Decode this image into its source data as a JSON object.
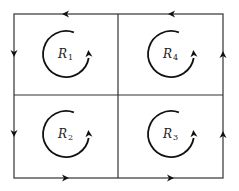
{
  "diagram": {
    "type": "region-decomposition",
    "outer_rectangle": {
      "x1": 14,
      "y1": 14,
      "x2": 223,
      "y2": 178
    },
    "divider": {
      "x": 118,
      "y": 95
    },
    "colors": {
      "stroke": "#333333",
      "background": "#ffffff"
    },
    "regions": [
      {
        "id": "R1",
        "letter": "R",
        "subscript": "1",
        "cx": 66,
        "cy": 54,
        "r": 23,
        "orientation": "counterclockwise"
      },
      {
        "id": "R4",
        "letter": "R",
        "subscript": "4",
        "cx": 171,
        "cy": 54,
        "r": 23,
        "orientation": "counterclockwise"
      },
      {
        "id": "R2",
        "letter": "R",
        "subscript": "2",
        "cx": 66,
        "cy": 134,
        "r": 23,
        "orientation": "counterclockwise"
      },
      {
        "id": "R3",
        "letter": "R",
        "subscript": "3",
        "cx": 171,
        "cy": 134,
        "r": 23,
        "orientation": "counterclockwise"
      }
    ],
    "boundary_arrows": [
      {
        "edge": "top-left",
        "x": 65,
        "y": 14,
        "direction": "left"
      },
      {
        "edge": "top-right",
        "x": 171,
        "y": 14,
        "direction": "left"
      },
      {
        "edge": "left-top",
        "x": 14,
        "y": 54,
        "direction": "down"
      },
      {
        "edge": "left-bottom",
        "x": 14,
        "y": 134,
        "direction": "down"
      },
      {
        "edge": "bottom-left",
        "x": 66,
        "y": 178,
        "direction": "right"
      },
      {
        "edge": "bottom-right",
        "x": 171,
        "y": 178,
        "direction": "right"
      },
      {
        "edge": "right-bottom",
        "x": 223,
        "y": 134,
        "direction": "up"
      },
      {
        "edge": "right-top",
        "x": 223,
        "y": 54,
        "direction": "up"
      }
    ]
  }
}
